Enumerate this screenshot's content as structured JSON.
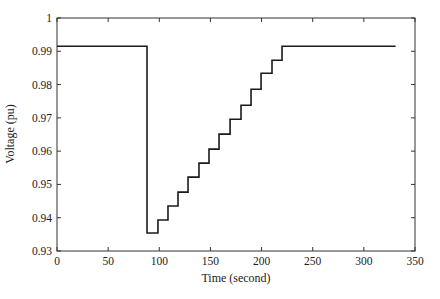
{
  "chart_data": {
    "type": "line",
    "title": "",
    "xlabel": "Time (second)",
    "ylabel": "Voltage (pu)",
    "xlim": [
      0,
      350
    ],
    "ylim": [
      0.93,
      1.0
    ],
    "xticks": [
      0,
      50,
      100,
      150,
      200,
      250,
      300,
      350
    ],
    "yticks": [
      0.93,
      0.94,
      0.95,
      0.96,
      0.97,
      0.98,
      0.99,
      1.0
    ],
    "xtick_labels": [
      "0",
      "50",
      "100",
      "150",
      "200",
      "250",
      "300",
      "350"
    ],
    "ytick_labels": [
      "0.93",
      "0.94",
      "0.95",
      "0.96",
      "0.97",
      "0.98",
      "0.99",
      "1"
    ],
    "grid": false,
    "legend": null,
    "series": [
      {
        "name": "Voltage",
        "color": "#1a1a1a",
        "step": true,
        "x": [
          0,
          88,
          88,
          98.7,
          108.5,
          118.3,
          128.1,
          138.8,
          148.6,
          158.4,
          169.2,
          179.9,
          189.7,
          199.5,
          210.2,
          220,
          331
        ],
        "y": [
          0.9915,
          0.9915,
          0.9354,
          0.9393,
          0.9435,
          0.9477,
          0.9522,
          0.9564,
          0.9606,
          0.9651,
          0.9696,
          0.9738,
          0.9786,
          0.9834,
          0.9873,
          0.9915,
          0.9915
        ]
      }
    ]
  }
}
